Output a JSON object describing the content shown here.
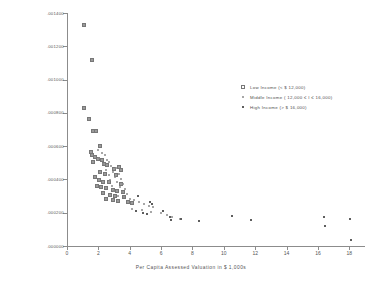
{
  "chart_data": {
    "type": "scatter",
    "title": "",
    "xlabel": "Per Capita Assessed Valuation  in $ 1,000s",
    "ylabel": "Tax Effort",
    "xlim": [
      0,
      19
    ],
    "ylim": [
      0,
      0.0014
    ],
    "grid": false,
    "legend_position": "upper right",
    "xticks": [
      "0",
      "2",
      "4",
      "6",
      "8",
      "10",
      "12",
      "14",
      "16",
      "18"
    ],
    "xtick_values": [
      0,
      2,
      4,
      6,
      8,
      10,
      12,
      14,
      16,
      18
    ],
    "yticks": [
      ".001400",
      ".001200",
      ".001000",
      ".000800",
      ".000600",
      ".000400",
      ".000200",
      ".000000"
    ],
    "ytick_values": [
      0.0014,
      0.0012,
      0.001,
      0.0008,
      0.0006,
      0.0004,
      0.0002,
      0.0
    ],
    "series": [
      {
        "name": "Low Income (< $ 12,000)",
        "marker": "open-square",
        "color": "#777777",
        "points": [
          [
            1.05,
            0.001335
          ],
          [
            1.55,
            0.001125
          ],
          [
            1.0,
            0.000838
          ],
          [
            1.35,
            0.00077
          ],
          [
            1.6,
            0.0007
          ],
          [
            1.8,
            0.0007
          ],
          [
            2.05,
            0.000608
          ],
          [
            1.45,
            0.00057
          ],
          [
            1.5,
            0.000555
          ],
          [
            1.7,
            0.00054
          ],
          [
            1.9,
            0.000528
          ],
          [
            2.15,
            0.00052
          ],
          [
            2.3,
            0.0005
          ],
          [
            1.62,
            0.000512
          ],
          [
            2.5,
            0.000495
          ],
          [
            2.95,
            0.00047
          ],
          [
            3.25,
            0.00048
          ],
          [
            3.35,
            0.000462
          ],
          [
            2.05,
            0.000452
          ],
          [
            2.35,
            0.00044
          ],
          [
            3.05,
            0.000432
          ],
          [
            1.75,
            0.000418
          ],
          [
            2.0,
            0.0004
          ],
          [
            2.2,
            0.000392
          ],
          [
            2.6,
            0.000388
          ],
          [
            3.4,
            0.000378
          ],
          [
            1.85,
            0.000368
          ],
          [
            2.1,
            0.00036
          ],
          [
            2.45,
            0.000352
          ],
          [
            2.85,
            0.000345
          ],
          [
            3.1,
            0.000338
          ],
          [
            3.5,
            0.00033
          ],
          [
            2.25,
            0.000322
          ],
          [
            2.7,
            0.000315
          ],
          [
            3.0,
            0.000305
          ],
          [
            3.6,
            0.000298
          ],
          [
            2.4,
            0.00029
          ],
          [
            2.9,
            0.000282
          ],
          [
            3.2,
            0.000275
          ],
          [
            3.8,
            0.000268
          ],
          [
            4.1,
            0.000262
          ]
        ]
      },
      {
        "name": "Middle Income ( 12,000 ≤ I ≤ 16,000)",
        "marker": "filled-circle",
        "color": "#8a8a8a",
        "points": [
          [
            1.95,
            0.000575
          ],
          [
            2.2,
            0.00056
          ],
          [
            2.4,
            0.000545
          ],
          [
            2.05,
            0.00053
          ],
          [
            2.55,
            0.000515
          ],
          [
            2.7,
            0.000505
          ],
          [
            2.3,
            0.00049
          ],
          [
            2.8,
            0.000478
          ],
          [
            3.15,
            0.000468
          ],
          [
            2.5,
            0.000455
          ],
          [
            2.95,
            0.000445
          ],
          [
            3.3,
            0.000435
          ],
          [
            2.65,
            0.000425
          ],
          [
            3.05,
            0.000412
          ],
          [
            3.45,
            0.000405
          ],
          [
            2.75,
            0.000395
          ],
          [
            3.2,
            0.000385
          ],
          [
            3.55,
            0.000372
          ],
          [
            2.85,
            0.000362
          ],
          [
            3.35,
            0.000352
          ],
          [
            3.7,
            0.000342
          ],
          [
            3.0,
            0.000332
          ],
          [
            3.5,
            0.000322
          ],
          [
            3.85,
            0.000312
          ],
          [
            3.25,
            0.000302
          ],
          [
            3.65,
            0.000292
          ],
          [
            4.0,
            0.000285
          ],
          [
            4.3,
            0.000275
          ],
          [
            4.6,
            0.000265
          ],
          [
            4.9,
            0.000252
          ],
          [
            5.2,
            0.000242
          ],
          [
            5.5,
            0.000235
          ],
          [
            4.15,
            0.000225
          ],
          [
            4.75,
            0.000215
          ],
          [
            5.35,
            0.000205
          ],
          [
            6.0,
            0.000198
          ],
          [
            6.4,
            0.000188
          ],
          [
            6.7,
            0.000172
          ],
          [
            7.2,
            0.000162
          ]
        ]
      },
      {
        "name": "High Income (> $ 16,000)",
        "marker": "filled-square",
        "color": "#5d5d5d",
        "points": [
          [
            4.55,
            0.000302
          ],
          [
            5.3,
            0.000262
          ],
          [
            5.45,
            0.000252
          ],
          [
            4.4,
            0.000208
          ],
          [
            4.85,
            0.000198
          ],
          [
            5.1,
            0.000192
          ],
          [
            6.1,
            0.000212
          ],
          [
            6.55,
            0.000172
          ],
          [
            6.6,
            0.000158
          ],
          [
            7.3,
            0.000162
          ],
          [
            8.4,
            0.000152
          ],
          [
            10.55,
            0.000178
          ],
          [
            11.75,
            0.000158
          ],
          [
            16.4,
            0.000172
          ],
          [
            16.45,
            0.000118
          ],
          [
            18.05,
            0.000165
          ],
          [
            18.1,
            3.5e-05
          ]
        ]
      }
    ]
  },
  "legend": {
    "items": [
      {
        "label": "Low Income (< $ 12,000)"
      },
      {
        "label": "Middle Income ( 12,000 ≤ I ≤ 16,000)"
      },
      {
        "label": "High Income (> $ 16,000)"
      }
    ]
  }
}
